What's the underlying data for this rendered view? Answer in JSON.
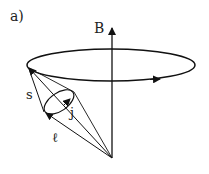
{
  "figure": {
    "panel_label": "a)",
    "labels": {
      "B": "B",
      "s": "s",
      "j": "j",
      "l": "ℓ"
    },
    "colors": {
      "stroke": "#111111",
      "background": "#ffffff"
    }
  }
}
